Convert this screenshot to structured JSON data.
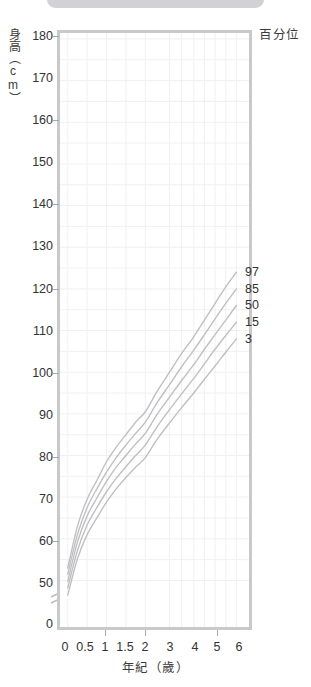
{
  "window": {
    "top_pill": "rounded-status-pill"
  },
  "chart_data": {
    "type": "line",
    "title": "",
    "xlabel": "年紀（歲）",
    "ylabel": "身高（cm）",
    "legend_title": "百分位",
    "legend_position": "right-inline",
    "grid": true,
    "xlim": [
      0,
      6
    ],
    "ylim": [
      45,
      180
    ],
    "y_axis_break": true,
    "y_break_value": 0,
    "x_tick_labels": [
      "0",
      "0.5",
      "1",
      "1.5",
      "2",
      "3",
      "4",
      "5",
      "6"
    ],
    "x_tick_values": [
      0,
      0.5,
      1,
      1.5,
      2,
      3,
      4,
      5,
      6
    ],
    "y_tick_labels": [
      "0",
      "50",
      "60",
      "70",
      "80",
      "90",
      "100",
      "110",
      "120",
      "130",
      "140",
      "150",
      "160",
      "170",
      "180"
    ],
    "y_tick_values": [
      45,
      50,
      60,
      70,
      80,
      90,
      100,
      110,
      120,
      130,
      140,
      150,
      160,
      170,
      180
    ],
    "x": [
      0,
      0.25,
      0.5,
      0.75,
      1,
      1.25,
      1.5,
      1.75,
      2,
      2.5,
      3,
      3.5,
      4,
      4.5,
      5,
      5.5,
      6
    ],
    "series": [
      {
        "name": "97",
        "label": "97",
        "values": [
          53.0,
          63.0,
          69.5,
          74.0,
          78.5,
          82.0,
          85.0,
          88.0,
          90.5,
          95.5,
          100.0,
          104.5,
          108.5,
          112.5,
          116.5,
          120.5,
          124.0
        ]
      },
      {
        "name": "85",
        "label": "85",
        "values": [
          51.5,
          61.0,
          67.5,
          72.0,
          76.0,
          79.5,
          82.5,
          85.3,
          88.0,
          92.8,
          97.0,
          101.3,
          105.3,
          109.0,
          112.8,
          116.5,
          120.0
        ]
      },
      {
        "name": "50",
        "label": "50",
        "values": [
          49.8,
          59.2,
          65.5,
          69.8,
          73.8,
          77.2,
          80.0,
          82.8,
          85.3,
          90.0,
          94.0,
          98.0,
          101.8,
          105.5,
          109.0,
          112.5,
          116.0
        ]
      },
      {
        "name": "15",
        "label": "15",
        "values": [
          48.2,
          57.2,
          63.3,
          67.5,
          71.3,
          74.5,
          77.3,
          80.0,
          82.5,
          87.0,
          91.0,
          94.8,
          98.5,
          102.0,
          105.5,
          108.8,
          112.0
        ]
      },
      {
        "name": "3",
        "label": "3",
        "values": [
          46.5,
          55.2,
          61.0,
          65.0,
          68.8,
          72.0,
          74.7,
          77.2,
          79.5,
          84.0,
          87.8,
          91.5,
          95.0,
          98.3,
          101.5,
          104.8,
          108.0
        ]
      }
    ],
    "colors": {
      "curve": "#bfbfc2",
      "grid": "#f0f0f4",
      "frame": "#c9c9cb",
      "text": "#333333"
    }
  }
}
